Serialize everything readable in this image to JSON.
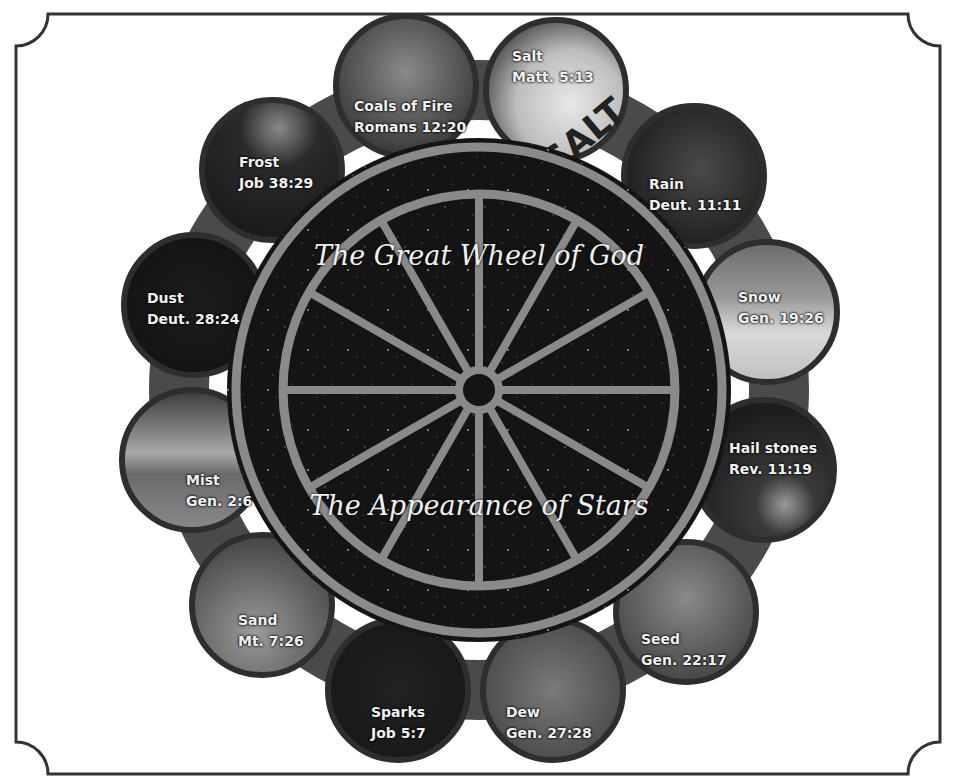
{
  "diagram": {
    "title_top": "The Great Wheel of God",
    "title_bottom": "The Appearance of Stars",
    "colors": {
      "frame": "#333333",
      "wheel_dark": "#141414",
      "spoke": "#8a8a8a",
      "ring_band": "#4a4a4a",
      "label_text": "#f2f2f2"
    },
    "spoke_count": 12,
    "medallions": [
      {
        "name": "Salt",
        "reference": "Matt. 5:13"
      },
      {
        "name": "Rain",
        "reference": "Deut. 11:11"
      },
      {
        "name": "Snow",
        "reference": "Gen. 19:26"
      },
      {
        "name": "Hail stones",
        "reference": "Rev. 11:19"
      },
      {
        "name": "Seed",
        "reference": "Gen. 22:17"
      },
      {
        "name": "Dew",
        "reference": "Gen. 27:28"
      },
      {
        "name": "Sparks",
        "reference": "Job 5:7"
      },
      {
        "name": "Sand",
        "reference": "Mt. 7:26"
      },
      {
        "name": "Mist",
        "reference": "Gen. 2:6"
      },
      {
        "name": "Dust",
        "reference": "Deut. 28:24"
      },
      {
        "name": "Frost",
        "reference": "Job 38:29"
      },
      {
        "name": "Coals of Fire",
        "reference": "Romans 12:20"
      }
    ]
  }
}
